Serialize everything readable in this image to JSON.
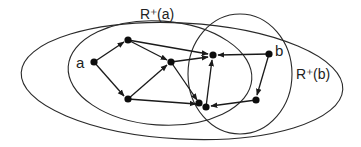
{
  "diagram": {
    "type": "directed-graph-reachability",
    "labels": {
      "node_a": "a",
      "node_b": "b",
      "set_a": "R⁺(a)",
      "set_b": "R⁺(b)"
    },
    "colors": {
      "stroke": "#1a1a1a",
      "node": "#0d0d0d",
      "background": "#ffffff"
    },
    "nodes": [
      {
        "id": "a",
        "x": 94,
        "y": 62,
        "label": "a"
      },
      {
        "id": "n1",
        "x": 128,
        "y": 40
      },
      {
        "id": "n2",
        "x": 128,
        "y": 99
      },
      {
        "id": "n3",
        "x": 171,
        "y": 62
      },
      {
        "id": "n4",
        "x": 213,
        "y": 55
      },
      {
        "id": "b",
        "x": 269,
        "y": 54,
        "label": "b"
      },
      {
        "id": "n5",
        "x": 256,
        "y": 100
      },
      {
        "id": "n6",
        "x": 199,
        "y": 103
      },
      {
        "id": "n7",
        "x": 206,
        "y": 107
      }
    ],
    "edges": [
      {
        "from": "a",
        "to": "n1"
      },
      {
        "from": "a",
        "to": "n2"
      },
      {
        "from": "n1",
        "to": "n3"
      },
      {
        "from": "n2",
        "to": "n3"
      },
      {
        "from": "n1",
        "to": "n4"
      },
      {
        "from": "n3",
        "to": "n4"
      },
      {
        "from": "n3",
        "to": "n6"
      },
      {
        "from": "n2",
        "to": "n7"
      },
      {
        "from": "n7",
        "to": "n4"
      },
      {
        "from": "b",
        "to": "n4"
      },
      {
        "from": "b",
        "to": "n5"
      },
      {
        "from": "n5",
        "to": "n7"
      }
    ],
    "regions": [
      {
        "id": "outer",
        "label": "",
        "shape": "ellipse"
      },
      {
        "id": "reach_a",
        "label": "R⁺(a)",
        "shape": "ellipse"
      },
      {
        "id": "reach_b",
        "label": "R⁺(b)",
        "shape": "ellipse"
      }
    ]
  }
}
